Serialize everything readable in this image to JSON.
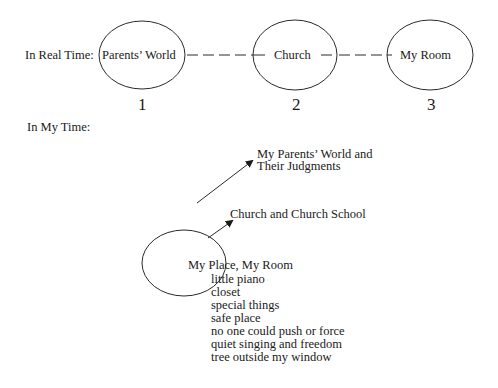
{
  "real_time": {
    "label": "In Real Time:",
    "nodes": [
      {
        "label": "Parents’ World",
        "number": "1"
      },
      {
        "label": "Church",
        "number": "2"
      },
      {
        "label": "My Room",
        "number": "3"
      }
    ]
  },
  "my_time": {
    "label": "In My Time:",
    "center": "My Place, My Room",
    "items": [
      "little piano",
      "closet",
      "special things",
      "safe place",
      "no one could push or force",
      "quiet singing and freedom",
      "tree outside my window"
    ],
    "arrows": [
      {
        "target_line1": "My Parents’ World and",
        "target_line2": "Their Judgments"
      },
      {
        "target": "Church and Church School"
      }
    ]
  },
  "colors": {
    "stroke": "#2a2a2a",
    "text": "#1a1a1a",
    "background": "#ffffff"
  }
}
